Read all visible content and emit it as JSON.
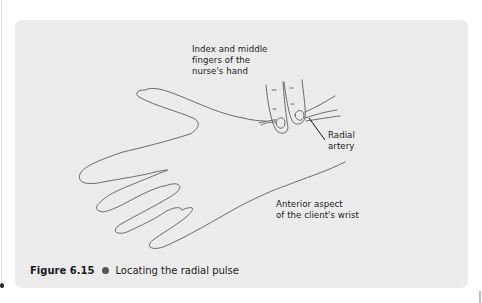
{
  "figure": {
    "number": "Figure 6.15",
    "title": "Locating the radial pulse",
    "labels": {
      "fingers": "Index and middle\nfingers of the\nnurse's hand",
      "artery": "Radial\nartery",
      "wrist": "Anterior aspect\nof the client's wrist"
    },
    "panel_color": "#ebebeb",
    "line_color": "#3a3a3a"
  }
}
